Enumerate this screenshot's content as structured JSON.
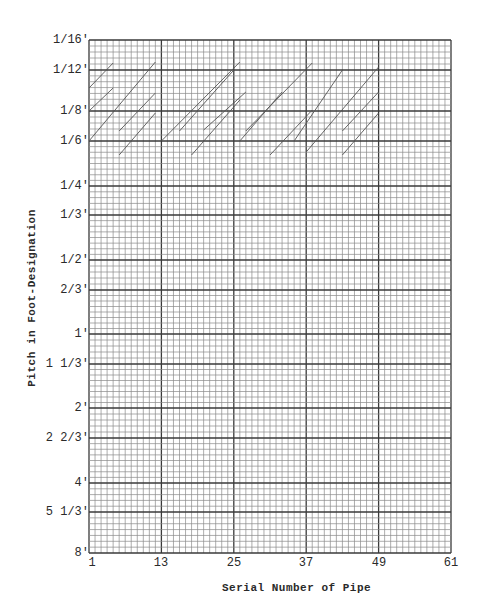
{
  "chart_data": {
    "type": "line",
    "title": "",
    "xlabel": "Serial Number of Pipe",
    "ylabel": "Pitch in Foot-Designation",
    "x_ticks": [
      1,
      13,
      25,
      37,
      49,
      61
    ],
    "xlim": [
      1,
      61
    ],
    "y_ticks": [
      "1/16'",
      "1/12'",
      "1/8'",
      "1/6'",
      "1/4'",
      "1/3'",
      "1/2'",
      "2/3'",
      "1'",
      "1 1/3'",
      "2'",
      "2 2/3'",
      "4'",
      "5 1/3'",
      "8'"
    ],
    "y_scale": "log (pitch decreasing upward, 1/16' top to 8' bottom)",
    "grid": true,
    "legend": null,
    "series": [
      {
        "name": "pipe-rank-segments",
        "segments": [
          [
            [
              1,
              88
            ],
            [
              5,
              63
            ]
          ],
          [
            [
              1,
              111
            ],
            [
              5,
              88
            ]
          ],
          [
            [
              1,
              141
            ],
            [
              12,
              62
            ]
          ],
          [
            [
              6,
              131
            ],
            [
              12,
              93
            ]
          ],
          [
            [
              6,
              155
            ],
            [
              12,
              113
            ]
          ],
          [
            [
              13,
              141
            ],
            [
              26,
              62
            ]
          ],
          [
            [
              16,
              131
            ],
            [
              25,
              70
            ]
          ],
          [
            [
              18,
              155
            ],
            [
              26,
              100
            ]
          ],
          [
            [
              20,
              130
            ],
            [
              27,
              92
            ]
          ],
          [
            [
              26,
              141
            ],
            [
              33,
              92
            ]
          ],
          [
            [
              27,
              131
            ],
            [
              38,
              63
            ]
          ],
          [
            [
              31,
              155
            ],
            [
              38,
              110
            ]
          ],
          [
            [
              35,
              141
            ],
            [
              43,
              70
            ]
          ],
          [
            [
              37,
              152
            ],
            [
              49,
              67
            ]
          ],
          [
            [
              43,
              131
            ],
            [
              49,
              92
            ]
          ],
          [
            [
              43,
              155
            ],
            [
              49,
              113
            ]
          ]
        ]
      }
    ]
  },
  "axes": {
    "x_title": "Serial Number of Pipe",
    "y_title": "Pitch in Foot-Designation",
    "x_tick_labels": [
      "1",
      "13",
      "25",
      "37",
      "49",
      "61"
    ],
    "y_tick_labels": [
      {
        "label": "1/16'",
        "y": 40
      },
      {
        "label": "1/12'",
        "y": 70
      },
      {
        "label": "1/8'",
        "y": 111
      },
      {
        "label": "1/6'",
        "y": 141
      },
      {
        "label": "1/4'",
        "y": 186
      },
      {
        "label": "1/3'",
        "y": 215
      },
      {
        "label": "1/2'",
        "y": 260
      },
      {
        "label": "2/3'",
        "y": 290
      },
      {
        "label": "1'",
        "y": 334
      },
      {
        "label": "1 1/3'",
        "y": 364
      },
      {
        "label": "2'",
        "y": 408
      },
      {
        "label": "2 2/3'",
        "y": 438
      },
      {
        "label": "4'",
        "y": 483
      },
      {
        "label": "5 1/3'",
        "y": 512
      },
      {
        "label": "8'",
        "y": 553
      }
    ]
  },
  "colors": {
    "grid_minor": "#8a8a8a",
    "grid_major": "#3a3a3a",
    "segment": "#555555",
    "text": "#2a2a2a"
  }
}
